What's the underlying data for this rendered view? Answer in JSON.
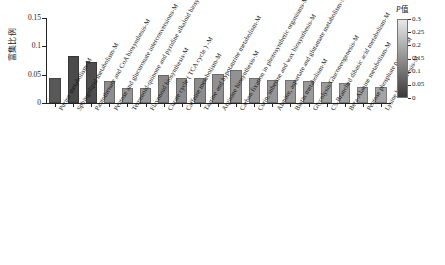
{
  "chart_data": {
    "type": "bar",
    "title": "",
    "xlabel": "",
    "ylabel": "富集比例",
    "ylim": [
      0,
      0.15
    ],
    "grid": false,
    "y_ticks": [
      0,
      0.05,
      0.1,
      0.15
    ],
    "y_tick_labels": [
      "0",
      "0.05",
      "0.1",
      "0.15"
    ],
    "categories": [
      "Purine metabolism-M",
      "Sphingolipid metabolism-M",
      "Pantothenate and CoA biosynthesis-M",
      "Pentose and glucuronate interconversions-M",
      "Terpenoid-quinone and pyridine alkaloid biosynthesis-M",
      "Flavonoid biosynthesis-M",
      "Citrate cycle ( TCA cycle ) -M",
      "Caffeine metabolism-M",
      "Taurine and hypotaurine metabolism-M",
      "Arginine biosynthesis-M",
      "Carbon fixation in photosynthetic organisms-M",
      "Cutin, suberine and wax biosynthesis-M",
      "Alanine, aspartate and glutamate metabolism-M",
      "Biotin metabolism-M",
      "Glycolysis/Gluconeogenesis-M",
      "C5-Branched dibasic acid metabolism-M",
      "Beta-Alanine metabolism-M",
      "Pentose phosphate pathway-M",
      "Lysine biosynthesis-M"
    ],
    "values": [
      0.044,
      0.083,
      0.073,
      0.038,
      0.027,
      0.027,
      0.05,
      0.045,
      0.045,
      0.052,
      0.058,
      0.045,
      0.04,
      0.04,
      0.038,
      0.037,
      0.035,
      0.028,
      0.028
    ],
    "p_values": [
      0.02,
      0.01,
      0.015,
      0.1,
      0.12,
      0.12,
      0.13,
      0.14,
      0.14,
      0.15,
      0.16,
      0.17,
      0.18,
      0.19,
      0.2,
      0.21,
      0.22,
      0.24,
      0.25
    ],
    "bar_colors": [
      "#585858",
      "#4a4a4a",
      "#4e4e4e",
      "#8e8e8e",
      "#959595",
      "#959595",
      "#8a8a8a",
      "#8c8c8c",
      "#8c8c8c",
      "#909090",
      "#929292",
      "#949494",
      "#969696",
      "#989898",
      "#9a9a9a",
      "#9c9c9c",
      "#9e9e9e",
      "#a2a2a2",
      "#a4a4a4"
    ]
  },
  "legend": {
    "title_p": "P",
    "title_suffix": "值",
    "ticks": [
      "0.3",
      "0.25",
      "0.2",
      "0.15",
      "0.1",
      "0.05",
      "0"
    ],
    "gradient_top_color": "#e8e8e8",
    "gradient_bottom_color": "#3a3a3a"
  }
}
